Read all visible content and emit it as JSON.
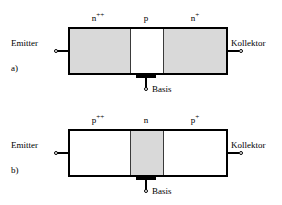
{
  "figure": {
    "width": 282,
    "height": 205,
    "background": "#ffffff",
    "ink": "#000000",
    "shade": "#d9d9d9"
  },
  "diagrams": [
    {
      "panel_label": "a)",
      "type": "npn-transistor-cross-section",
      "terminals": {
        "left": "Emitter",
        "right": "Kollektor",
        "bottom": "Basis"
      },
      "regions": [
        {
          "label": "n",
          "superscript": "++",
          "shaded": true
        },
        {
          "label": "p",
          "superscript": "",
          "shaded": false
        },
        {
          "label": "n",
          "superscript": "+",
          "shaded": true
        }
      ]
    },
    {
      "panel_label": "b)",
      "type": "pnp-transistor-cross-section",
      "terminals": {
        "left": "Emitter",
        "right": "Kollektor",
        "bottom": "Basis"
      },
      "regions": [
        {
          "label": "p",
          "superscript": "++",
          "shaded": false
        },
        {
          "label": "n",
          "superscript": "",
          "shaded": true
        },
        {
          "label": "p",
          "superscript": "+",
          "shaded": false
        }
      ]
    }
  ]
}
